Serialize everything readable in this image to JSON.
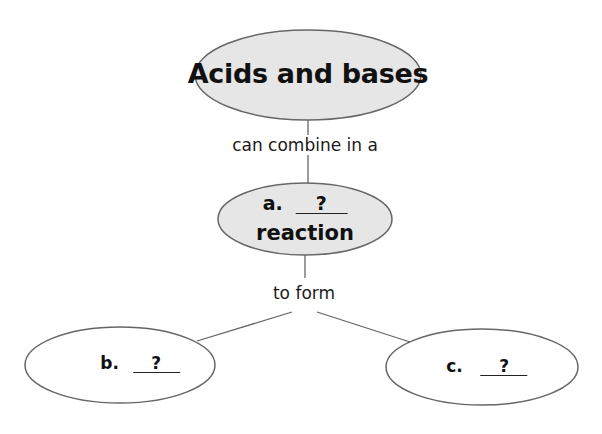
{
  "diagram": {
    "type": "concept-map",
    "colors": {
      "filled_node": "#e6e6e6",
      "empty_node": "#ffffff",
      "stroke": "#666666",
      "text": "#111111"
    },
    "nodes": {
      "top": {
        "label": "Acids and bases"
      },
      "middle": {
        "prefix": "a.",
        "blank": "?",
        "suffix": "reaction"
      },
      "left": {
        "prefix": "b.",
        "blank": "?"
      },
      "right": {
        "prefix": "c.",
        "blank": "?"
      }
    },
    "links": {
      "top_to_middle": "can combine in a",
      "middle_to_bottom": "to form"
    }
  }
}
